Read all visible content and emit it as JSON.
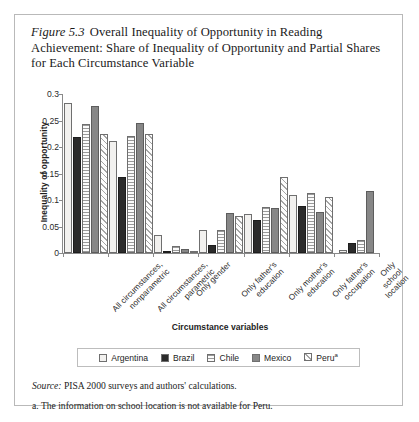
{
  "figure": {
    "number_label": "Figure 5.3",
    "title": "Overall Inequality of Opportunity in Reading Achievement: Share of Inequality of Opportunity and Partial Shares for Each Circumstance Variable",
    "source_prefix": "Source:",
    "source_text": "PISA 2000 surveys and authors' calculations.",
    "footnote": "a. The information on school location is not available for Peru."
  },
  "legend": {
    "position": "bottom",
    "entries": [
      {
        "name": "Argentina",
        "swatch": "white-empty"
      },
      {
        "name": "Brazil",
        "swatch": "solid-black"
      },
      {
        "name": "Chile",
        "swatch": "horizontal-lines"
      },
      {
        "name": "Mexico",
        "swatch": "solid-gray"
      },
      {
        "name": "Peru",
        "superscript": "a",
        "swatch": "diagonal-hatch"
      }
    ]
  },
  "chart_data": {
    "type": "bar",
    "title": "Overall Inequality of Opportunity in Reading Achievement: Share of Inequality of Opportunity and Partial Shares for Each Circumstance Variable",
    "xlabel": "Circumstance variables",
    "ylabel": "Inequality of opportunity",
    "ylim": [
      0,
      0.3
    ],
    "yticks": [
      0,
      0.05,
      0.1,
      0.15,
      0.2,
      0.25,
      0.3
    ],
    "ytick_labels": [
      "0",
      "0.05",
      "0.1",
      "0.15",
      "0.2",
      "0.25",
      "0.3"
    ],
    "grid": false,
    "legend_position": "bottom",
    "categories": [
      "All circumstances, nonparametric",
      "All circumstances, parametric",
      "Only gender",
      "Only father's education",
      "Only mother's education",
      "Only father's occupation",
      "Only school location"
    ],
    "series": [
      {
        "name": "Argentina",
        "values": [
          0.283,
          0.212,
          0.034,
          0.044,
          0.073,
          0.11,
          0.006
        ]
      },
      {
        "name": "Brazil",
        "values": [
          0.218,
          0.143,
          0.003,
          0.016,
          0.063,
          0.089,
          0.018
        ]
      },
      {
        "name": "Chile",
        "values": [
          0.243,
          0.221,
          0.013,
          0.044,
          0.086,
          0.114,
          0.024
        ]
      },
      {
        "name": "Mexico",
        "values": [
          0.277,
          0.246,
          0.008,
          0.075,
          0.084,
          0.078,
          0.117
        ]
      },
      {
        "name": "Peru",
        "values": [
          0.225,
          0.224,
          0.001,
          0.07,
          0.143,
          0.105,
          null
        ]
      }
    ]
  }
}
